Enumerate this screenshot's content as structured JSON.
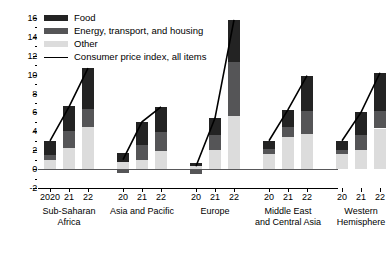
{
  "chart_data": {
    "type": "bar",
    "title": "",
    "subtitle": "",
    "xlabel": "",
    "ylabel": "",
    "ylim": [
      -2,
      16
    ],
    "yticks": [
      -2,
      0,
      2,
      4,
      6,
      8,
      10,
      12,
      14,
      16
    ],
    "ytick_labels": [
      "-2",
      "0",
      "2",
      "4",
      "6",
      "8",
      "10",
      "12",
      "14",
      "16"
    ],
    "minor_ticks": true,
    "grid": false,
    "stacked": true,
    "legend_position": "top-left",
    "legend": [
      {
        "key": "food",
        "label": "Food",
        "color": "#232323",
        "marker": "swatch"
      },
      {
        "key": "energy",
        "label": "Energy, transport, and housing",
        "color": "#555557",
        "marker": "swatch"
      },
      {
        "key": "other",
        "label": "Other",
        "color": "#dcdcdc",
        "marker": "swatch"
      },
      {
        "key": "cpi",
        "label": "Consumer price index, all items",
        "color": "#000000",
        "marker": "line"
      }
    ],
    "groups": [
      {
        "name": "Sub-Saharan Africa",
        "name_lines": [
          "Sub-Saharan",
          "Africa"
        ],
        "categories": [
          "2020",
          "21",
          "22"
        ],
        "other": [
          1.0,
          2.2,
          4.5
        ],
        "energy": [
          0.5,
          1.8,
          1.9
        ],
        "food": [
          1.5,
          2.7,
          4.3
        ],
        "cpi": [
          3.0,
          6.6,
          10.7
        ]
      },
      {
        "name": "Asia and Pacific",
        "name_lines": [
          "Asia and Pacific"
        ],
        "categories": [
          "20",
          "21",
          "22"
        ],
        "other": [
          0.8,
          1.0,
          1.9
        ],
        "energy": [
          -0.4,
          1.6,
          2.0
        ],
        "food": [
          0.9,
          2.4,
          2.7
        ],
        "cpi": [
          1.0,
          5.0,
          6.6
        ]
      },
      {
        "name": "Europe",
        "name_lines": [
          "Europe"
        ],
        "categories": [
          "20",
          "21",
          "22"
        ],
        "other": [
          0.3,
          2.0,
          5.6
        ],
        "energy": [
          -0.5,
          1.6,
          5.7
        ],
        "food": [
          0.3,
          1.8,
          4.5
        ],
        "cpi": [
          0.3,
          5.4,
          15.8
        ]
      },
      {
        "name": "Middle East and Central Asia",
        "name_lines": [
          "Middle East",
          "and Central Asia"
        ],
        "categories": [
          "20",
          "21",
          "22"
        ],
        "other": [
          1.6,
          3.4,
          3.7
        ],
        "energy": [
          0.5,
          1.1,
          2.5
        ],
        "food": [
          0.9,
          1.8,
          3.7
        ],
        "cpi": [
          3.0,
          6.3,
          9.9
        ]
      },
      {
        "name": "Western Hemisphere",
        "name_lines": [
          "Western",
          "Hemisphere"
        ],
        "categories": [
          "20",
          "21",
          "22"
        ],
        "other": [
          1.6,
          2.0,
          4.3
        ],
        "energy": [
          0.4,
          1.6,
          1.9
        ],
        "food": [
          1.0,
          2.4,
          4.0
        ],
        "cpi": [
          3.0,
          6.0,
          10.2
        ]
      }
    ]
  }
}
